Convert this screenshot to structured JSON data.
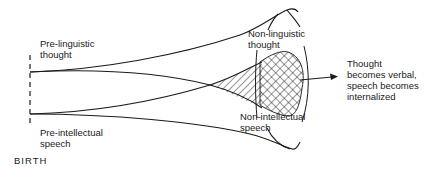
{
  "diagram": {
    "title": "",
    "labels": {
      "pre_linguistic_thought": "Pre-linguistic\nthought",
      "pre_intellectual_speech": "Pre-intellectual\nspeech",
      "birth": "BIRTH",
      "non_linguistic_thought": "Non-linguistic\nthought",
      "non_intellectual_speech": "Non-intellectual\nspeech",
      "outcome": "Thought\nbecomes verbal,\nspeech becomes\ninternalized"
    },
    "colors": {
      "line": "#1a1a1a",
      "background": "#ffffff"
    }
  }
}
